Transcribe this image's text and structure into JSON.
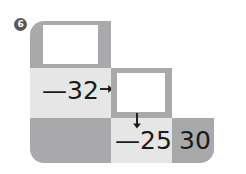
{
  "exercise": {
    "number": "6",
    "type": "arithmetic-chain-grid"
  },
  "grid": {
    "cells": [
      {
        "id": "r1c1",
        "fill": "medium",
        "content": "answer-box",
        "value": ""
      },
      {
        "id": "r2c1",
        "fill": "light",
        "content": "operation",
        "value": "—32"
      },
      {
        "id": "r2c2",
        "fill": "medium",
        "content": "answer-box",
        "value": ""
      },
      {
        "id": "r3c1",
        "fill": "dark",
        "content": "empty",
        "value": ""
      },
      {
        "id": "r3c2",
        "fill": "light",
        "content": "operation",
        "value": "—25"
      },
      {
        "id": "r3c3",
        "fill": "dark",
        "content": "number",
        "value": "30"
      }
    ]
  },
  "labels": {
    "op_subtract_32": "—32",
    "op_subtract_25": "—25",
    "result_30": "30"
  },
  "arrows": [
    {
      "id": "arrow-right-from-32",
      "direction": "right"
    },
    {
      "id": "arrow-down-to-25",
      "direction": "down"
    }
  ],
  "colors": {
    "cell_medium": "#a9a9ab",
    "cell_light": "#e6e6e6",
    "cell_dark": "#a9a9ab",
    "answer_box": "#ffffff",
    "text": "#1a1a1a",
    "badge_bg": "#58585a",
    "badge_text": "#ffffff",
    "page_bg": "#ffffff"
  }
}
